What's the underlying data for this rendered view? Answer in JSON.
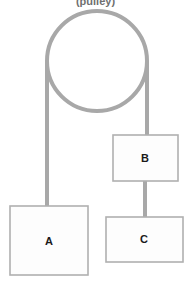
{
  "diagram": {
    "caption": "(pulley)",
    "background_color": "#ffffff",
    "rope_color": "#a8a8a8",
    "box_border_color": "#b0b0b0",
    "box_fill_color": "#fdfdfd",
    "label_color": "#1a1a1a",
    "caption_color": "#6f6f6f",
    "pulley": {
      "name": "pulley",
      "shape": "circle",
      "center_x": 97,
      "center_y": 61,
      "radius": 50,
      "stroke_width": 4
    },
    "ropes": [
      {
        "name": "rope-left-pulley-to-a",
        "x": 47,
        "y_top": 61,
        "y_bottom": 207,
        "stroke_width": 4
      },
      {
        "name": "rope-right-pulley-to-b",
        "x": 147,
        "y_top": 61,
        "y_bottom": 136,
        "stroke_width": 4
      },
      {
        "name": "rope-b-to-c",
        "x": 145,
        "y_top": 181,
        "y_bottom": 218,
        "stroke_width": 4
      }
    ],
    "blocks": [
      {
        "name": "block-a",
        "label": "A",
        "x": 10,
        "y": 206,
        "width": 78,
        "height": 69,
        "label_x": 49,
        "label_y": 241
      },
      {
        "name": "block-b",
        "label": "B",
        "x": 113,
        "y": 135,
        "width": 65,
        "height": 46,
        "label_x": 145,
        "label_y": 158
      },
      {
        "name": "block-c",
        "label": "C",
        "x": 106,
        "y": 217,
        "width": 77,
        "height": 45,
        "label_x": 144,
        "label_y": 239
      }
    ]
  }
}
